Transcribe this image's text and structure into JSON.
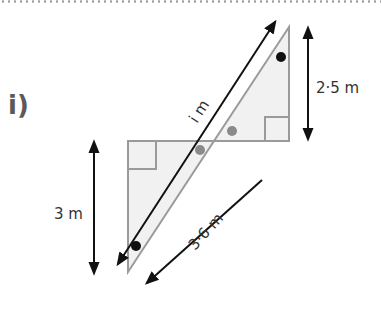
{
  "question": {
    "label": "i)"
  },
  "diagram": {
    "labels": {
      "hypotenuse_unknown": "i m",
      "upper_height": "2·5 m",
      "lower_height": "3 m",
      "lower_segment": "3·6 m"
    },
    "colors": {
      "triangle_fill": "#f1f1f1",
      "triangle_stroke": "#9a9a9a",
      "arrow": "#111111",
      "dot_black": "#111111",
      "dot_gray": "#8a8a8a"
    }
  }
}
